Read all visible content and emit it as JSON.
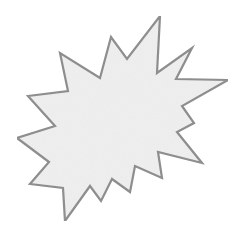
{
  "shape": {
    "type": "starburst",
    "fill_color": "#efefef",
    "stroke_color": "#8c8c8c",
    "stroke_width": 2.2,
    "points": "160,16 157,73 192,48 176,79 228,80 182,106 194,123 177,132 202,163 158,152 162,178 135,166 130,192 112,179 101,201 90,186 65,221 63,188 30,184 49,162 17,138 55,126 28,96 68,91 60,53 100,78 111,37 127,59",
    "background_color": "#ffffff"
  }
}
